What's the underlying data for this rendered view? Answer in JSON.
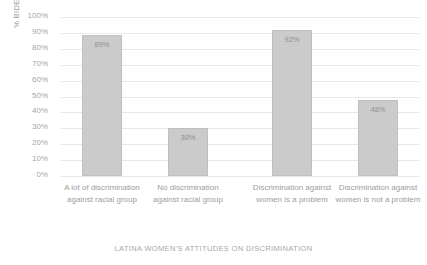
{
  "chart_data": {
    "type": "bar",
    "title": "",
    "xlabel": "LATINA WOMEN'S ATTITUDES ON DISCRIMINATION",
    "ylabel": "% BIDEN VOTERS",
    "ylim": [
      0,
      100
    ],
    "grid": true,
    "legend": "none",
    "categories": [
      "A lot of discrimination against racial group",
      "No discrimination against racial group",
      "Discrimination against women is a problem",
      "Discrimination against women is not a problem"
    ],
    "values": [
      89,
      30,
      92,
      48
    ],
    "value_labels": [
      "89%",
      "30%",
      "92%",
      "48%"
    ],
    "y_ticks": [
      0,
      10,
      20,
      30,
      40,
      50,
      60,
      70,
      80,
      90,
      100
    ],
    "y_tick_labels": [
      "0%",
      "10%",
      "20%",
      "30%",
      "40%",
      "50%",
      "60%",
      "70%",
      "80%",
      "90%",
      "100%"
    ],
    "bar_color": "#cbcbcb",
    "bar_border_color": "#c0c0c0",
    "gridline_color": "#e8e8e8",
    "text_color": "#9d9d9d"
  }
}
